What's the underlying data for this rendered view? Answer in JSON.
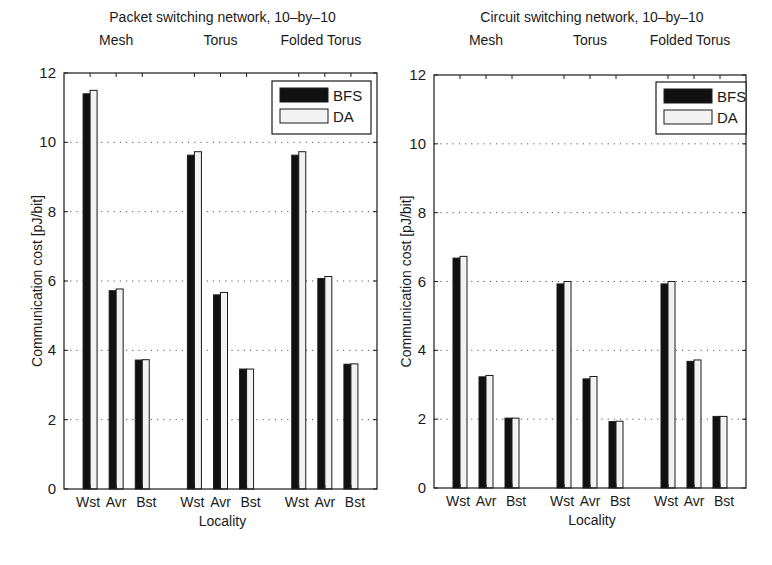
{
  "figure": {
    "colors": {
      "bfs": "#111111",
      "da": "#f2f2f2",
      "axis": "#1a1a1a",
      "grid": "#555555",
      "background": "#ffffff"
    }
  },
  "chart_data": [
    {
      "type": "bar",
      "title": "Packet switching network, 10–by–10",
      "group_labels": [
        "Mesh",
        "Torus",
        "Folded Torus"
      ],
      "categories": [
        "Wst",
        "Avr",
        "Bst"
      ],
      "xlabel": "Locality",
      "ylabel": "Communication cost [pJ/bit]",
      "ylim": [
        0,
        12
      ],
      "yticks": [
        0,
        2,
        4,
        6,
        8,
        10,
        12
      ],
      "grid": "y-dotted",
      "legend": {
        "position": "upper-right",
        "entries": [
          "BFS",
          "DA"
        ]
      },
      "series": [
        {
          "name": "BFS",
          "groups": {
            "Mesh": [
              11.4,
              5.72,
              3.72
            ],
            "Torus": [
              9.63,
              5.6,
              3.46
            ],
            "Folded Torus": [
              9.63,
              6.07,
              3.6
            ]
          }
        },
        {
          "name": "DA",
          "groups": {
            "Mesh": [
              11.5,
              5.77,
              3.73
            ],
            "Torus": [
              9.73,
              5.67,
              3.46
            ],
            "Folded Torus": [
              9.73,
              6.13,
              3.61
            ]
          }
        }
      ]
    },
    {
      "type": "bar",
      "title": "Circuit switching network, 10–by–10",
      "group_labels": [
        "Mesh",
        "Torus",
        "Folded Torus"
      ],
      "categories": [
        "Wst",
        "Avr",
        "Bst"
      ],
      "xlabel": "Locality",
      "ylabel": "Communication cost [pJ/bit]",
      "ylim": [
        0,
        12
      ],
      "yticks": [
        0,
        2,
        4,
        6,
        8,
        10,
        12
      ],
      "grid": "y-dotted",
      "legend": {
        "position": "upper-right",
        "entries": [
          "BFS",
          "DA"
        ]
      },
      "series": [
        {
          "name": "BFS",
          "groups": {
            "Mesh": [
              6.68,
              3.23,
              2.03
            ],
            "Torus": [
              5.93,
              3.17,
              1.93
            ],
            "Folded Torus": [
              5.93,
              3.68,
              2.08
            ]
          }
        },
        {
          "name": "DA",
          "groups": {
            "Mesh": [
              6.73,
              3.27,
              2.03
            ],
            "Torus": [
              6.0,
              3.24,
              1.94
            ],
            "Folded Torus": [
              6.0,
              3.72,
              2.08
            ]
          }
        }
      ]
    }
  ]
}
